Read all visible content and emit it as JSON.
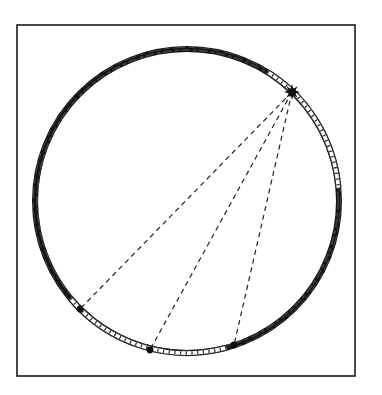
{
  "canvas": {
    "width": 382,
    "height": 395,
    "background": "#ffffff"
  },
  "frame": {
    "x": 17,
    "y": 25,
    "width": 338,
    "height": 351,
    "stroke": "#1a1a1a",
    "stroke_width": 1.6
  },
  "ring": {
    "cx": 187,
    "cy": 201,
    "r": 152,
    "dark_color": "#141414",
    "light_color": "#ffffff",
    "hatch_color": "#2a2a2a",
    "thickness": 6,
    "light_segments_deg": [
      {
        "from": -58,
        "to": -5
      },
      {
        "from": 75,
        "to": 140
      }
    ]
  },
  "source": {
    "name": "star",
    "x": 292,
    "y": 92,
    "points": 8,
    "outer_r": 8,
    "inner_r": 3.6,
    "color": "#111111"
  },
  "targets": [
    {
      "name": "dot-1",
      "x": 80,
      "y": 309
    },
    {
      "name": "dot-2",
      "x": 150,
      "y": 350
    },
    {
      "name": "dot-3",
      "x": 234,
      "y": 345
    }
  ],
  "rays": {
    "dash": "5 4",
    "stroke": "#222222",
    "stroke_width": 1.2
  },
  "dot_style": {
    "r": 3.4,
    "color": "#0d0d0d"
  }
}
